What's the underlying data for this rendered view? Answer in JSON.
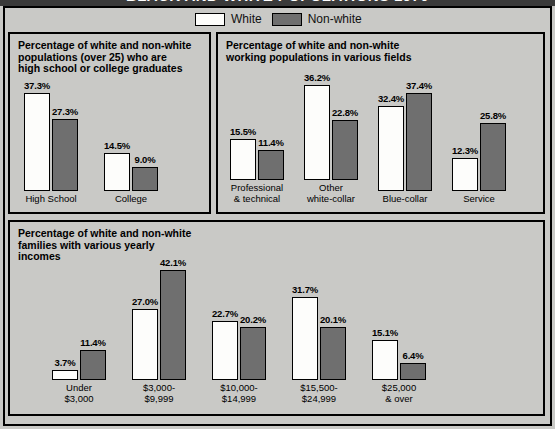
{
  "poster": {
    "title": "BLACK AND WHITE POPULATIONS 1970",
    "background_color": "#c9c9c6",
    "title_band_color": "#3a3a3a"
  },
  "legend": {
    "items": [
      {
        "label": "White",
        "swatch": "white-swatch",
        "color": "#fdfdfb"
      },
      {
        "label": "Non-white",
        "swatch": "nonwhite-swatch",
        "color": "#6f6f6f"
      }
    ]
  },
  "panels": [
    {
      "id": "education",
      "title": "Percentage of white and non-white\npopulations (over 25) who are\nhigh school or college graduates"
    },
    {
      "id": "occupation",
      "title": "Percentage of white and non-white\nworking populations in various fields"
    },
    {
      "id": "income",
      "title": "Percentage of white and non-white\nfamilies with various yearly\nincomes"
    }
  ],
  "chart_data": [
    {
      "type": "bar",
      "id": "education",
      "title": "Percentage of white and non-white populations (over 25) who are high school or college graduates",
      "categories": [
        "High School",
        "College"
      ],
      "series": [
        {
          "name": "White",
          "values": [
            37.3,
            14.5
          ],
          "labels": [
            "37.3%",
            "14.5%"
          ],
          "color": "#fdfdfb"
        },
        {
          "name": "Non-white",
          "values": [
            27.3,
            9.0
          ],
          "labels": [
            "27.3%",
            "9.0%"
          ],
          "color": "#6f6f6f"
        }
      ],
      "ylabel": "",
      "xlabel": "",
      "ylim": [
        0,
        45
      ],
      "grid": false,
      "legend_position": "top-center"
    },
    {
      "type": "bar",
      "id": "occupation",
      "title": "Percentage of white and non-white working populations in various fields",
      "categories": [
        "Professional\n& technical",
        "Other\nwhite-collar",
        "Blue-collar",
        "Service"
      ],
      "series": [
        {
          "name": "White",
          "values": [
            15.5,
            36.2,
            32.4,
            12.3
          ],
          "labels": [
            "15.5%",
            "36.2%",
            "32.4%",
            "12.3%"
          ],
          "color": "#fdfdfb"
        },
        {
          "name": "Non-white",
          "values": [
            11.4,
            22.8,
            37.4,
            25.8
          ],
          "labels": [
            "11.4%",
            "22.8%",
            "37.4%",
            "25.8%"
          ],
          "color": "#6f6f6f"
        }
      ],
      "ylabel": "",
      "xlabel": "",
      "ylim": [
        0,
        45
      ],
      "grid": false,
      "legend_position": "top-center"
    },
    {
      "type": "bar",
      "id": "income",
      "title": "Percentage of white and non-white families with various yearly incomes",
      "categories": [
        "Under\n$3,000",
        "$3,000-\n$9,999",
        "$10,000-\n$14,999",
        "$15,500-\n$24,999",
        "$25,000\n& over"
      ],
      "series": [
        {
          "name": "White",
          "values": [
            3.7,
            27.0,
            22.7,
            31.7,
            15.1
          ],
          "labels": [
            "3.7%",
            "27.0%",
            "22.7%",
            "31.7%",
            "15.1%"
          ],
          "color": "#fdfdfb"
        },
        {
          "name": "Non-white",
          "values": [
            11.4,
            42.1,
            20.2,
            20.1,
            6.4
          ],
          "labels": [
            "11.4%",
            "42.1%",
            "20.2%",
            "20.1%",
            "6.4%"
          ],
          "color": "#6f6f6f"
        }
      ],
      "ylabel": "",
      "xlabel": "",
      "ylim": [
        0,
        45
      ],
      "grid": false,
      "legend_position": "top-center"
    }
  ]
}
